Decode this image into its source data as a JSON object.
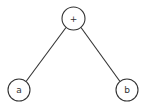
{
  "diagram": {
    "type": "expression-tree",
    "stroke_color": "#333333",
    "background": "#ffffff",
    "nodes": [
      {
        "id": "root",
        "label": "+",
        "cx": 73.5,
        "cy": 18.5,
        "r": 11.5
      },
      {
        "id": "left",
        "label": "a",
        "cx": 19,
        "cy": 90,
        "r": 11
      },
      {
        "id": "right",
        "label": "b",
        "cx": 127,
        "cy": 90,
        "r": 11
      }
    ],
    "edges": [
      {
        "from": "root",
        "to": "left"
      },
      {
        "from": "root",
        "to": "right"
      }
    ]
  }
}
